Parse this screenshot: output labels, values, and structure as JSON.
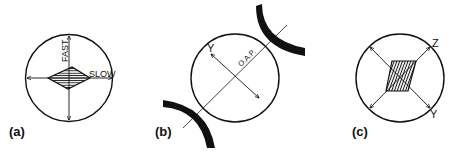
{
  "figure": {
    "panels": [
      {
        "id": "a",
        "label": "(a)",
        "axis_labels": {
          "vertical": "FAST",
          "horizontal": "SLOW"
        },
        "shape": "hatched-diamond"
      },
      {
        "id": "b",
        "label": "(b)",
        "axis_labels": {
          "axis": "Y",
          "line": "O.A.P."
        },
        "shape": "circle-between-curved-jaws"
      },
      {
        "id": "c",
        "label": "(c)",
        "axis_labels": {
          "upper": "Z",
          "lower": "Y"
        },
        "shape": "hatched-parallelogram"
      }
    ],
    "colors": {
      "ink": "#111111",
      "background": "#ffffff"
    }
  }
}
